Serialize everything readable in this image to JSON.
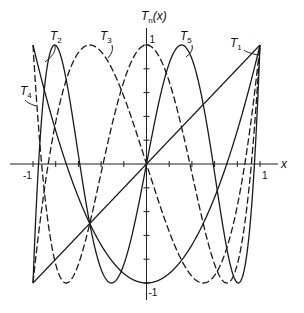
{
  "chart_data": {
    "type": "line",
    "title": "",
    "xlabel": "x",
    "ylabel": "T_n(x)",
    "xlim": [
      -1,
      1
    ],
    "ylim": [
      -1,
      1
    ],
    "grid": false,
    "x_tick_labels": [
      "-1",
      "1"
    ],
    "y_tick_labels": [
      "1",
      "-1"
    ],
    "x_minor_ticks": 10,
    "y_minor_ticks": 10,
    "series": [
      {
        "name": "T_1",
        "n": 1,
        "formula": "x",
        "style": "solid",
        "values_at": {
          "x": [
            -1,
            0,
            1
          ],
          "y": [
            -1,
            0,
            1
          ]
        }
      },
      {
        "name": "T_2",
        "n": 2,
        "formula": "2x^2 - 1",
        "style": "solid",
        "values_at": {
          "x": [
            -1,
            0,
            1
          ],
          "y": [
            1,
            -1,
            1
          ]
        }
      },
      {
        "name": "T_3",
        "n": 3,
        "formula": "4x^3 - 3x",
        "style": "dashed",
        "values_at": {
          "x": [
            -1,
            -0.5,
            0,
            0.5,
            1
          ],
          "y": [
            -1,
            1,
            0,
            -1,
            1
          ]
        }
      },
      {
        "name": "T_4",
        "n": 4,
        "formula": "8x^4 - 8x^2 + 1",
        "style": "dashed",
        "values_at": {
          "x": [
            -1,
            -0.707,
            0,
            0.707,
            1
          ],
          "y": [
            1,
            -1,
            1,
            -1,
            1
          ]
        }
      },
      {
        "name": "T_5",
        "n": 5,
        "formula": "16x^5 - 20x^3 + 5x",
        "style": "solid",
        "values_at": {
          "x": [
            -1,
            -0.809,
            -0.309,
            0,
            0.309,
            0.809,
            1
          ],
          "y": [
            -1,
            1,
            -1,
            0,
            1,
            -1,
            1
          ]
        }
      }
    ],
    "annotations": [
      {
        "text": "T",
        "sub": "2",
        "x": 50,
        "y": 40
      },
      {
        "text": "T",
        "sub": "3",
        "x": 100,
        "y": 40
      },
      {
        "text": "T",
        "sub": "4",
        "x": 20,
        "y": 95
      },
      {
        "text": "T",
        "sub": "5",
        "x": 180,
        "y": 40
      },
      {
        "text": "T",
        "sub": "1",
        "x": 230,
        "y": 47
      },
      {
        "text": "T",
        "sub": "n",
        "x": 141,
        "y": 20,
        "suffix": "(x)"
      }
    ]
  },
  "frame": {
    "x_left_px": 33,
    "x_right_px": 260,
    "y_top_px": 45,
    "y_bottom_px": 283,
    "x_axis_y_px": 164
  }
}
